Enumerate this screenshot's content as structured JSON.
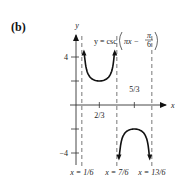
{
  "panel_label": "(b)",
  "chart_data": {
    "type": "line",
    "equation": {
      "lhs": "y = csc",
      "pi_x": "πx −",
      "frac_num": "π",
      "frac_den": "6"
    },
    "xlabel": "x",
    "ylabel": "y",
    "x_ticks": [
      {
        "value": 0.6667,
        "label": "2/3"
      },
      {
        "value": 1.6667,
        "label": "5/3"
      }
    ],
    "y_ticks": [
      {
        "value": 4,
        "label": "4"
      },
      {
        "value": 1,
        "label": ""
      },
      {
        "value": -1,
        "label": ""
      },
      {
        "value": -4,
        "label": "−4"
      }
    ],
    "asymptotes": [
      {
        "x": 0.1667,
        "label": "x = 1/6"
      },
      {
        "x": 1.1667,
        "label": "x = 7/6"
      },
      {
        "x": 2.1667,
        "label": "x = 13/6"
      }
    ],
    "series": [
      {
        "name": "branch-up",
        "x_range": [
          0.1667,
          1.1667
        ],
        "min_point": [
          0.6667,
          1
        ]
      },
      {
        "name": "branch-down",
        "x_range": [
          1.1667,
          2.1667
        ],
        "max_point": [
          1.6667,
          -1
        ]
      }
    ],
    "grid": false,
    "colors": {
      "curve": "#111111",
      "asymptote": "#555555",
      "axis": "#333333"
    }
  }
}
